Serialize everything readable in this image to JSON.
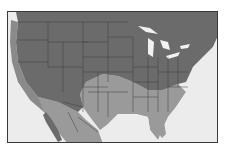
{
  "map": {
    "title": "",
    "region": "North America (United States, southern Canada, northern Mexico)",
    "colors": {
      "background_ocean": "#ececec",
      "range_dark": "#6b6b6b",
      "range_light": "#9a9a9a",
      "coastal_band": "#8a8a8a",
      "lakes": "#f2f2f2",
      "borders": "#3f3f3f",
      "frame": "#3a3a3a"
    },
    "zones": [
      {
        "name": "dark-zone",
        "description": "Northern and western US and southern Canada"
      },
      {
        "name": "light-zone",
        "description": "Southern Plains, Gulf Coast, Southeast, Mexico"
      },
      {
        "name": "coastal-band",
        "description": "Pacific coast strip"
      }
    ]
  }
}
